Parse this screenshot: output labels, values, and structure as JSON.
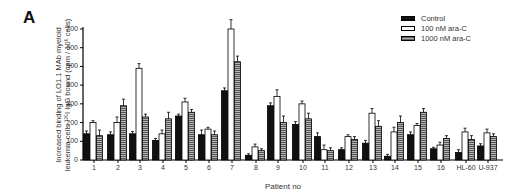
{
  "panel_label": "A",
  "chart_data": {
    "type": "bar",
    "title": "",
    "xlabel": "Patient no",
    "ylabel_lines": [
      "Increased binding of LO1.1 MAb myeloid",
      "leukemia cells ¹²⁵I IgG bound (cpm / 10⁵ cells)"
    ],
    "ylim": [
      0,
      700
    ],
    "yticks": [
      0,
      100,
      200,
      300,
      400,
      500,
      600,
      700
    ],
    "grid": false,
    "legend_position": "top-right",
    "categories": [
      "1",
      "2",
      "3",
      "4",
      "5",
      "6",
      "7",
      "8",
      "9",
      "10",
      "11",
      "12",
      "13",
      "14",
      "15",
      "16",
      "HL-60",
      "U-937"
    ],
    "series": [
      {
        "name": "Control",
        "fill": "#111111",
        "values": [
          140,
          135,
          140,
          105,
          235,
          135,
          370,
          25,
          290,
          190,
          125,
          55,
          90,
          20,
          135,
          60,
          40,
          75
        ],
        "errors": [
          15,
          15,
          12,
          10,
          10,
          25,
          15,
          8,
          15,
          15,
          20,
          10,
          15,
          10,
          15,
          8,
          15,
          12
        ]
      },
      {
        "name": "100 nM ara-C",
        "fill": "#ffffff",
        "values": [
          200,
          200,
          490,
          140,
          310,
          165,
          700,
          70,
          340,
          300,
          55,
          125,
          250,
          150,
          185,
          80,
          150,
          145
        ],
        "errors": [
          10,
          30,
          25,
          20,
          20,
          10,
          50,
          15,
          35,
          15,
          25,
          10,
          25,
          25,
          10,
          15,
          20,
          20
        ]
      },
      {
        "name": "1000 nM ara-C",
        "fill": "#8a8a8a",
        "values": [
          130,
          290,
          230,
          220,
          255,
          135,
          525,
          50,
          200,
          220,
          50,
          110,
          180,
          200,
          255,
          115,
          110,
          125
        ],
        "errors": [
          30,
          35,
          15,
          35,
          15,
          20,
          30,
          10,
          35,
          30,
          15,
          15,
          30,
          35,
          20,
          15,
          20,
          15
        ]
      }
    ]
  }
}
